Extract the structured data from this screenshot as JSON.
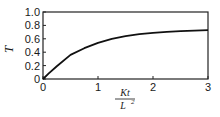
{
  "chart_data": {
    "type": "line",
    "title": "",
    "xlabel": "Kt / L^2",
    "xlabel_numerator": "Kt",
    "xlabel_denominator": "L",
    "xlabel_denominator_exp": "2",
    "ylabel": "T",
    "xlim": [
      0,
      3
    ],
    "ylim": [
      0,
      1.0
    ],
    "x_ticks": [
      "0",
      "1",
      "2",
      "3"
    ],
    "y_ticks": [
      "0",
      "0.2",
      "0.4",
      "0.6",
      "0.8",
      "1.0"
    ],
    "grid": false,
    "legend": null,
    "series": [
      {
        "name": "T",
        "x": [
          0,
          0.1,
          0.25,
          0.5,
          0.75,
          1.0,
          1.25,
          1.5,
          1.75,
          2.0,
          2.25,
          2.5,
          2.75,
          3.0
        ],
        "y": [
          0,
          0.08,
          0.19,
          0.36,
          0.46,
          0.54,
          0.6,
          0.64,
          0.67,
          0.69,
          0.705,
          0.715,
          0.722,
          0.73
        ]
      }
    ],
    "colors": {
      "line": "#111111",
      "axis": "#222222"
    }
  }
}
